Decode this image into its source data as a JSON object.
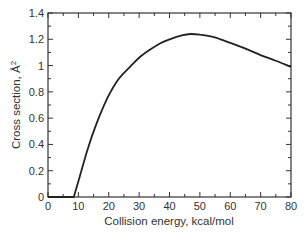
{
  "chart_data": {
    "type": "line",
    "title": "",
    "xlabel": "Collision energy, kcal/mol",
    "ylabel": "Cross section, Å",
    "ylabel_superscript": "2",
    "xlim": [
      0,
      80
    ],
    "ylim": [
      0,
      1.4
    ],
    "x_ticks": [
      0,
      10,
      20,
      30,
      40,
      50,
      60,
      70,
      80
    ],
    "x_tick_labels": [
      "0",
      "10",
      "20",
      "30",
      "40",
      "50",
      "60",
      "70",
      "80"
    ],
    "y_ticks": [
      0,
      0.2,
      0.4,
      0.6,
      0.8,
      1.0,
      1.2,
      1.4
    ],
    "y_tick_labels": [
      "0",
      "0.2",
      "0.4",
      "0.6",
      "0.8",
      "1",
      "1.2",
      "1.4"
    ],
    "grid": false,
    "legend": null,
    "series": [
      {
        "name": "Cross section",
        "color": "#222222",
        "x": [
          0,
          8.5,
          10,
          13,
          16,
          19.5,
          23,
          27,
          30,
          33.5,
          37,
          40,
          44,
          47,
          50,
          54,
          58,
          62,
          66,
          70,
          74,
          78,
          80
        ],
        "y": [
          0,
          0,
          0.12,
          0.36,
          0.56,
          0.75,
          0.89,
          0.99,
          1.06,
          1.12,
          1.17,
          1.2,
          1.23,
          1.24,
          1.235,
          1.22,
          1.19,
          1.155,
          1.12,
          1.08,
          1.045,
          1.01,
          0.99
        ]
      }
    ]
  }
}
